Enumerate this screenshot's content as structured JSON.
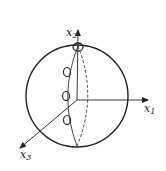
{
  "diagram": {
    "type": "sphere-with-axes",
    "axes": [
      {
        "name": "x1",
        "label": "x",
        "subscript": "1",
        "direction": "right"
      },
      {
        "name": "x2",
        "label": "x",
        "subscript": "2",
        "direction": "up"
      },
      {
        "name": "x3",
        "label": "x",
        "subscript": "3",
        "direction": "down-left"
      }
    ],
    "sphere": {
      "cx": 77,
      "cy": 96,
      "r": 51
    },
    "meridian": {
      "style": "front solid, back dashed"
    },
    "markers": [
      {
        "name": "pole-marker",
        "cx": 78,
        "cy": 47
      },
      {
        "name": "marker-1",
        "cx": 67,
        "cy": 72
      },
      {
        "name": "marker-2",
        "cx": 66,
        "cy": 96
      },
      {
        "name": "marker-3",
        "cx": 67,
        "cy": 120
      }
    ],
    "colors": {
      "stroke": "#222222",
      "background": "#ffffff"
    }
  }
}
